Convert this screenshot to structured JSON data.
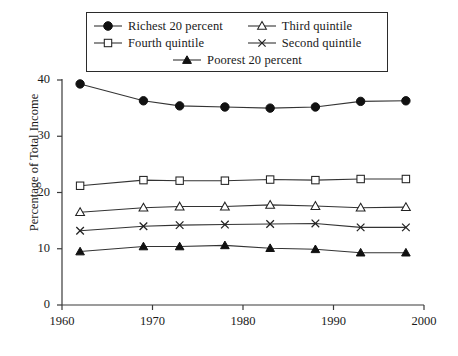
{
  "chart_data": {
    "type": "line",
    "title": "",
    "xlabel": "",
    "ylabel": "Percentage of Total Income",
    "xlim": [
      1960,
      2000
    ],
    "ylim": [
      0,
      40
    ],
    "xticks": [
      1960,
      1970,
      1980,
      1990,
      2000
    ],
    "xtick_labels": [
      "1960",
      "1970",
      "1980",
      "1990",
      "2000"
    ],
    "yticks": [
      0,
      10,
      20,
      30,
      40
    ],
    "ytick_labels": [
      "0",
      "10",
      "20",
      "30",
      "40"
    ],
    "grid": false,
    "legend_position": "top-center",
    "x": [
      1962,
      1969,
      1973,
      1978,
      1983,
      1988,
      1993,
      1998
    ],
    "series": [
      {
        "name": "Richest 20 percent",
        "marker": "filled-circle",
        "values": [
          39.3,
          36.3,
          35.4,
          35.2,
          35.0,
          35.2,
          36.2,
          36.3
        ]
      },
      {
        "name": "Third quintile",
        "marker": "open-triangle-up",
        "values": [
          16.5,
          17.3,
          17.5,
          17.5,
          17.8,
          17.6,
          17.3,
          17.4
        ]
      },
      {
        "name": "Fourth quintile",
        "marker": "open-square",
        "values": [
          21.2,
          22.2,
          22.1,
          22.1,
          22.3,
          22.2,
          22.4,
          22.4
        ]
      },
      {
        "name": "Second quintile",
        "marker": "cross-x",
        "values": [
          13.2,
          14.0,
          14.2,
          14.3,
          14.4,
          14.5,
          13.8,
          13.8
        ]
      },
      {
        "name": "Poorest 20 percent",
        "marker": "filled-triangle-up",
        "values": [
          9.5,
          10.4,
          10.4,
          10.6,
          10.1,
          9.9,
          9.3,
          9.3
        ]
      }
    ],
    "legend_entries": [
      {
        "label": "Richest 20 percent",
        "marker": "filled-circle"
      },
      {
        "label": "Third quintile",
        "marker": "open-triangle-up"
      },
      {
        "label": "Fourth quintile",
        "marker": "open-square"
      },
      {
        "label": "Second quintile",
        "marker": "cross-x"
      },
      {
        "label": "Poorest 20 percent",
        "marker": "filled-triangle-up"
      }
    ],
    "colors": {
      "line": "#333333",
      "marker_fill": "#111111",
      "marker_stroke": "#222222",
      "axis": "#3a3a3a",
      "background": "#ffffff"
    }
  }
}
